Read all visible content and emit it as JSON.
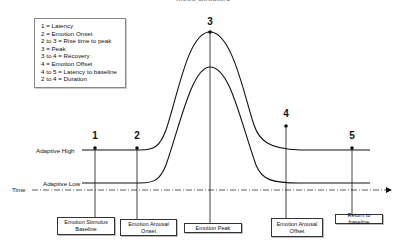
{
  "title": "Mood Structure",
  "legend": {
    "items": [
      "1 = Latency",
      "2 = Emotion Onset",
      "2 to 3 = Rise time to peak",
      "3 = Peak",
      "3 to 4 = Recovery",
      "4 = Emotion Offset",
      "4 to 5 = Latency to baseline",
      "2 to 4 = Duration"
    ]
  },
  "axis": {
    "time_label": "Time",
    "adaptive_high_label": "Adaptive High",
    "adaptive_low_label": "Adaptive Low"
  },
  "markers": [
    {
      "number": "1",
      "box_label": "Emotion Stimulus Baseline"
    },
    {
      "number": "2",
      "box_label": "Emotion Arousal Onset"
    },
    {
      "number": "3",
      "box_label": "Emotion Peak"
    },
    {
      "number": "4",
      "box_label": "Emotion Arousal Offset"
    },
    {
      "number": "5",
      "box_label": "Return to baseline"
    }
  ],
  "colors": {
    "line": "#111111",
    "box_border": "#333333"
  }
}
